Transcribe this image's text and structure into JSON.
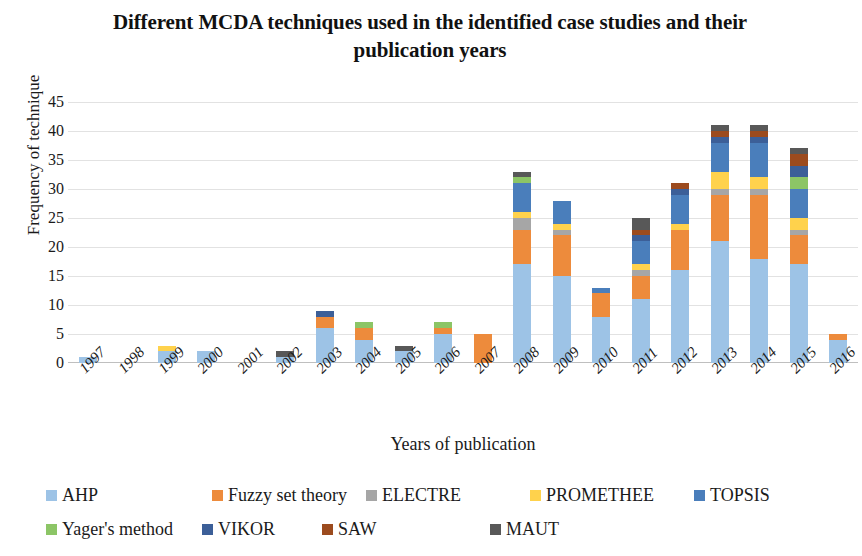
{
  "chart_data": {
    "type": "bar",
    "subtype": "stacked-bar",
    "title": "Different MCDA techniques used in the identified case studies and their publication years",
    "xlabel": "Years of publication",
    "ylabel": "Frequency of technique",
    "ylim": [
      0,
      45
    ],
    "ytick_labels": [
      "0",
      "5",
      "10",
      "15",
      "20",
      "25",
      "30",
      "35",
      "40",
      "45"
    ],
    "yticks": [
      0,
      5,
      10,
      15,
      20,
      25,
      30,
      35,
      40,
      45
    ],
    "grid": true,
    "legend_position": "bottom",
    "categories": [
      "1997",
      "1998",
      "1999",
      "2000",
      "2001",
      "2002",
      "2003",
      "2004",
      "2005",
      "2006",
      "2007",
      "2008",
      "2009",
      "2010",
      "2011",
      "2012",
      "2013",
      "2014",
      "2015",
      "2016"
    ],
    "series": [
      {
        "name": "AHP",
        "color": "#9DC3E6",
        "values": [
          1,
          0,
          2,
          2,
          0,
          1,
          6,
          4,
          2,
          5,
          0,
          17,
          15,
          8,
          11,
          16,
          21,
          18,
          17,
          4
        ]
      },
      {
        "name": "Fuzzy set theory",
        "color": "#ED8B3C",
        "values": [
          0,
          0,
          0,
          0,
          0,
          0,
          2,
          2,
          0,
          1,
          5,
          6,
          7,
          4,
          4,
          7,
          8,
          11,
          5,
          1
        ]
      },
      {
        "name": "ELECTRE",
        "color": "#A6A6A6",
        "values": [
          0,
          0,
          0,
          0,
          0,
          0,
          0,
          0,
          0,
          0,
          0,
          2,
          1,
          0,
          1,
          0,
          1,
          1,
          1,
          0
        ]
      },
      {
        "name": "PROMETHEE",
        "color": "#FFD24C",
        "values": [
          0,
          0,
          1,
          0,
          0,
          0,
          0,
          0,
          0,
          0,
          0,
          1,
          1,
          0,
          1,
          1,
          3,
          2,
          2,
          0
        ]
      },
      {
        "name": "TOPSIS",
        "color": "#4A7EBB",
        "values": [
          0,
          0,
          0,
          0,
          0,
          0,
          0,
          0,
          0,
          0,
          0,
          5,
          4,
          1,
          4,
          5,
          5,
          6,
          5,
          0
        ]
      },
      {
        "name": "Yager's method",
        "color": "#8CC566",
        "values": [
          0,
          0,
          0,
          0,
          0,
          0,
          0,
          1,
          0,
          1,
          0,
          1,
          0,
          0,
          0,
          0,
          0,
          0,
          2,
          0
        ]
      },
      {
        "name": "VIKOR",
        "color": "#3C5F98",
        "values": [
          0,
          0,
          0,
          0,
          0,
          0,
          1,
          0,
          0,
          0,
          0,
          0,
          0,
          0,
          1,
          1,
          1,
          1,
          2,
          0
        ]
      },
      {
        "name": "SAW",
        "color": "#9C4B1E",
        "values": [
          0,
          0,
          0,
          0,
          0,
          0,
          0,
          0,
          0,
          0,
          0,
          0,
          0,
          0,
          1,
          1,
          1,
          1,
          2,
          0
        ]
      },
      {
        "name": "MAUT",
        "color": "#585858",
        "values": [
          0,
          0,
          0,
          0,
          0,
          1,
          0,
          0,
          1,
          0,
          0,
          1,
          0,
          0,
          2,
          0,
          1,
          1,
          1,
          0
        ]
      }
    ],
    "totals": [
      1,
      0,
      3,
      2,
      0,
      2,
      9,
      7,
      3,
      7,
      5,
      34,
      27,
      13,
      25,
      31,
      41,
      41,
      37,
      5
    ]
  },
  "legend": {
    "rows": [
      [
        {
          "label": "AHP",
          "color": "#9DC3E6",
          "x": 46
        },
        {
          "label": "Fuzzy set theory",
          "color": "#ED8B3C",
          "x": 212
        },
        {
          "label": "ELECTRE",
          "color": "#A6A6A6",
          "x": 366
        },
        {
          "label": "PROMETHEE",
          "color": "#FFD24C",
          "x": 530
        },
        {
          "label": "TOPSIS",
          "color": "#4A7EBB",
          "x": 694
        }
      ],
      [
        {
          "label": "Yager's method",
          "color": "#8CC566",
          "x": 46
        },
        {
          "label": "VIKOR",
          "color": "#3C5F98",
          "x": 202
        },
        {
          "label": "SAW",
          "color": "#9C4B1E",
          "x": 322
        },
        {
          "label": "MAUT",
          "color": "#585858",
          "x": 490
        }
      ]
    ]
  }
}
